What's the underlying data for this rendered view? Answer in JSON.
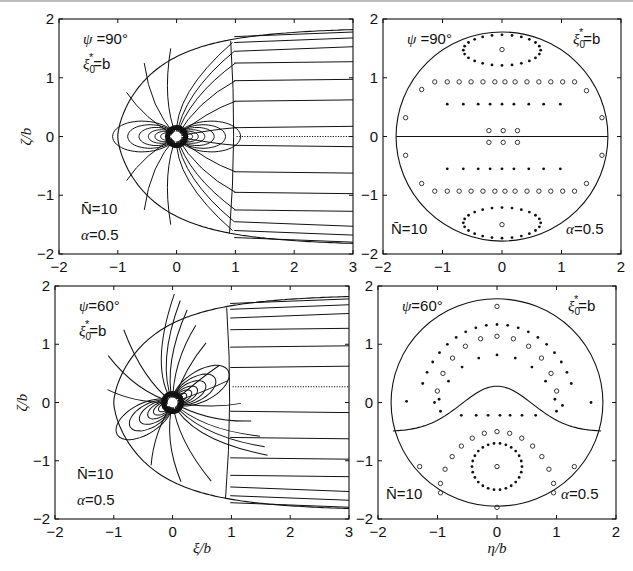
{
  "chart_data": [
    {
      "id": "top-left",
      "type": "line",
      "title": "",
      "xlabel": "",
      "ylabel": "ζ/b",
      "xlim": [
        -2,
        3
      ],
      "ylim": [
        -2,
        2
      ],
      "xticks": [
        "-2",
        "-1",
        "0",
        "1",
        "2",
        "3"
      ],
      "yticks": [
        "-2",
        "-1",
        "0",
        "1",
        "2"
      ],
      "annotations": {
        "psi": "ψ =90°",
        "xi": "ξ0*=b",
        "N": "N̄=10",
        "alpha": "α=0.5"
      },
      "description": "Field/stream lines around a dipole-like source at origin within a parabolic boundary; boundary vertex at ξ=-1, vertical line near ξ=1, dotted line at ζ=0 from ξ=1 to 3",
      "tilt_deg": 0,
      "boundary_vertex": -1,
      "dotted_y": 0
    },
    {
      "id": "top-right",
      "type": "scatter",
      "xlabel": "",
      "ylabel": "",
      "xlim": [
        -2,
        2
      ],
      "ylim": [
        -2,
        2
      ],
      "xticks": [
        "-2",
        "-1",
        "0",
        "1",
        "2"
      ],
      "yticks": [
        "-2",
        "-1",
        "0",
        "1",
        "2"
      ],
      "annotations": {
        "psi": "ψ =90°",
        "xi": "ξ0*=b",
        "N": "N̄=10",
        "alpha": "α=0.5"
      },
      "circle_radius": 1.78,
      "divider": "horizontal line at 0",
      "rows": [
        {
          "y": 1.48,
          "x": [
            0
          ],
          "marker": "o"
        },
        {
          "y": 0.93,
          "x": [
            -1.13,
            -0.92,
            -0.72,
            -0.52,
            -0.32,
            -0.12,
            0.05,
            0.22,
            0.42,
            0.62,
            0.82,
            1.02,
            1.22
          ],
          "marker": "o"
        },
        {
          "y": 0.55,
          "x": [
            -0.92,
            -0.65,
            -0.4,
            -0.2,
            0,
            0.2,
            0.45,
            0.7,
            0.98
          ],
          "marker": "."
        },
        {
          "y": 0.1,
          "x": [
            -0.22,
            0.02,
            0.26
          ],
          "marker": "o"
        },
        {
          "y": -0.1,
          "x": [
            -0.22,
            0.02,
            0.26
          ],
          "marker": "o"
        },
        {
          "y": -0.55,
          "x": [
            -0.92,
            -0.65,
            -0.4,
            -0.2,
            0,
            0.2,
            0.45,
            0.7,
            0.98
          ],
          "marker": "."
        },
        {
          "y": -0.93,
          "x": [
            -1.13,
            -0.92,
            -0.72,
            -0.52,
            -0.32,
            -0.12,
            0.05,
            0.22,
            0.42,
            0.62,
            0.82,
            1.02,
            1.22
          ],
          "marker": "o"
        },
        {
          "y": -1.5,
          "x": [
            0
          ],
          "marker": "o"
        }
      ],
      "edge_points": [
        [
          -1.62,
          0.32
        ],
        [
          1.68,
          0.32
        ],
        [
          -1.62,
          -0.32
        ],
        [
          1.68,
          -0.32
        ],
        [
          -1.35,
          0.8
        ],
        [
          1.42,
          0.78
        ],
        [
          -1.35,
          -0.8
        ],
        [
          1.42,
          -0.8
        ]
      ],
      "rings": [
        {
          "cx": 0,
          "cy": 1.47,
          "rx": 0.65,
          "ry": 0.26
        },
        {
          "cx": 0,
          "cy": -1.47,
          "rx": 0.65,
          "ry": 0.26
        }
      ]
    },
    {
      "id": "bottom-left",
      "type": "line",
      "xlabel": "ξ/b",
      "ylabel": "ζ/b",
      "xlim": [
        -2,
        3
      ],
      "ylim": [
        -2,
        2
      ],
      "xticks": [
        "-2",
        "-1",
        "0",
        "1",
        "2",
        "3"
      ],
      "yticks": [
        "-2",
        "-1",
        "0",
        "1",
        "2"
      ],
      "annotations": {
        "psi": "ψ=60°",
        "xi": "ξ0*=b",
        "N": "N̄=10",
        "alpha": "α=0.5"
      },
      "description": "Tilted dipole field lines (60°) within a parabolic boundary; dotted line at ζ≈0.27 from ξ=1 to 3",
      "tilt_deg": 30,
      "boundary_vertex": -1,
      "dotted_y": 0.27
    },
    {
      "id": "bottom-right",
      "type": "scatter",
      "xlabel": "η/b",
      "ylabel": "",
      "xlim": [
        -2,
        2
      ],
      "ylim": [
        -2,
        2
      ],
      "xticks": [
        "-2",
        "-1",
        "0",
        "1",
        "2"
      ],
      "yticks": [
        "-2",
        "-1",
        "0",
        "1",
        "2"
      ],
      "annotations": {
        "psi": "ψ=60°",
        "xi": "ξ0*=b",
        "N": "N̄=10",
        "alpha": "α=0.5"
      },
      "circle_radius": 1.78,
      "divider": "curved line from (-1.75,-0.5) peaking at (0,0.28) to (1.75,-0.5)",
      "arcs": [
        {
          "cy": -0.2,
          "r": 1.62,
          "n": 19,
          "marker": ".",
          "span": [
            20,
            160
          ]
        },
        {
          "cy": -0.05,
          "r": 1.25,
          "n": 11,
          "marker": "o",
          "span": [
            12,
            168
          ]
        },
        {
          "cy": -0.4,
          "r": 1.28,
          "n": 9,
          "marker": ".",
          "span": [
            22,
            158
          ]
        },
        {
          "cy": -1.7,
          "r": 1.2,
          "n": 13,
          "marker": "o",
          "span": [
            15,
            165
          ]
        }
      ],
      "row": {
        "y": -0.22,
        "x": [
          -0.6,
          -0.35,
          -0.15,
          0.05,
          0.22,
          0.42,
          0.65
        ],
        "marker": "."
      },
      "ring": {
        "cx": 0,
        "cy": -1.1,
        "rx": 0.42,
        "ry": 0.4
      },
      "center_point": [
        0,
        -1.1
      ],
      "extra_points": [
        [
          0,
          1.65
        ],
        [
          -1.52,
          0.02
        ],
        [
          1.58,
          0
        ],
        [
          -1.05,
          0
        ],
        [
          1.1,
          -0.05
        ],
        [
          -0.95,
          -0.15
        ],
        [
          1.0,
          -0.15
        ],
        [
          -1.3,
          -1.1
        ],
        [
          1.3,
          -1.1
        ],
        [
          -0.95,
          -1.55
        ],
        [
          0.95,
          -1.55
        ],
        [
          0,
          -1.8
        ]
      ]
    }
  ],
  "figure": {
    "panels": [
      {
        "name": "top-left",
        "x0": 59,
        "x1": 353,
        "y0": 19,
        "y1": 254
      },
      {
        "name": "top-right",
        "x0": 383,
        "x1": 621,
        "y0": 19,
        "y1": 254
      },
      {
        "name": "bottom-left",
        "x0": 55,
        "x1": 349,
        "y0": 286,
        "y1": 519
      },
      {
        "name": "bottom-right",
        "x0": 378,
        "x1": 616,
        "y0": 286,
        "y1": 519
      }
    ]
  }
}
